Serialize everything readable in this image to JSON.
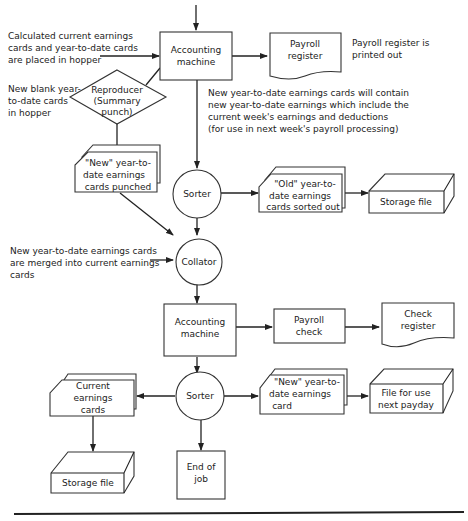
{
  "nodes": {
    "accounting_machine_1": [
      "Accounting",
      "machine"
    ],
    "payroll_register": [
      "Payroll",
      "register"
    ],
    "reproducer": [
      "Reproducer",
      "(Summary",
      "punch)"
    ],
    "new_ytd_cards_punched": [
      "\"New\" year-to-",
      "date earnings",
      "cards punched"
    ],
    "sorter_1": [
      "Sorter"
    ],
    "old_ytd_cards": [
      "\"Old\" year-to-",
      "date earnings",
      "cards sorted out"
    ],
    "storage_file_1": [
      "Storage file"
    ],
    "collator": [
      "Collator"
    ],
    "accounting_machine_2": [
      "Accounting",
      "machine"
    ],
    "payroll_check": [
      "Payroll",
      "check"
    ],
    "check_register": [
      "Check",
      "register"
    ],
    "current_earnings_cards": [
      "Current",
      "earnings",
      "cards"
    ],
    "sorter_2": [
      "Sorter"
    ],
    "new_ytd_card": [
      "\"New\" year-to-",
      "date earnings",
      "card"
    ],
    "file_next_payday": [
      "File for use",
      "next payday"
    ],
    "storage_file_2": [
      "Storage file"
    ],
    "end_of_job": [
      "End of",
      "job"
    ]
  },
  "notes": {
    "hopper_input": [
      "Calculated current earnings",
      "cards and year-to-date cards",
      "are placed in hopper"
    ],
    "register_printed": [
      "Payroll register is",
      "printed out"
    ],
    "blank_cards": [
      "New blank year-",
      "to-date cards",
      "in hopper"
    ],
    "new_ytd_explanation": [
      "New year-to-date earnings cards will contain",
      "new year-to-date earnings which include the",
      "current week's earnings and deductions",
      "(for use in next week's payroll processing)"
    ],
    "merge_note": [
      "New year-to-date earnings cards",
      "are merged into current earnings",
      "cards"
    ]
  }
}
